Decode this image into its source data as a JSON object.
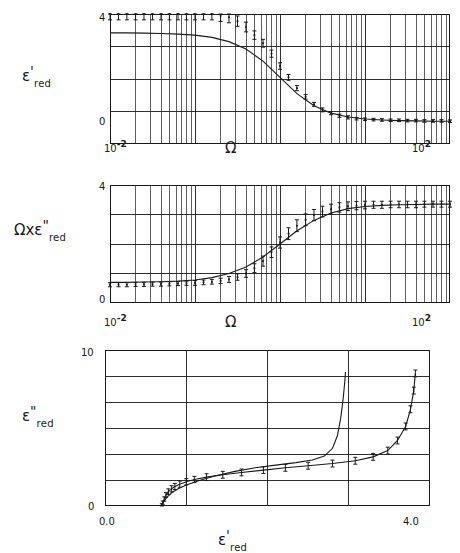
{
  "figure": {
    "background": "#ffffff",
    "ink": "#1a1a1a"
  },
  "chart_data": [
    {
      "id": "panel-eps-real",
      "type": "line",
      "title": "",
      "xlabel": "Ω",
      "ylabel": "ε'red",
      "ylabel_parts": {
        "base": "ε",
        "prime": "'",
        "sub": "red"
      },
      "xscale": "log",
      "xlim": [
        0.01,
        100
      ],
      "ylim": [
        0,
        4
      ],
      "xtick_labels": [
        "10-2",
        "102"
      ],
      "xtick_mantissa": "10",
      "xtick_exponents": [
        "-2",
        "2"
      ],
      "ytick_labels": [
        "0",
        "4"
      ],
      "grid": "log-minor-vertical + 4-horizontal",
      "series": [
        {
          "name": "model-curve",
          "kind": "line",
          "x": [
            0.01,
            0.0158,
            0.0251,
            0.0398,
            0.0631,
            0.1,
            0.158,
            0.251,
            0.398,
            0.631,
            1.0,
            1.585,
            2.512,
            3.981,
            6.31,
            10.0,
            15.85,
            25.12,
            39.81,
            63.1,
            100.0
          ],
          "y": [
            3.42,
            3.42,
            3.41,
            3.4,
            3.38,
            3.35,
            3.28,
            3.15,
            2.92,
            2.55,
            2.05,
            1.55,
            1.18,
            0.95,
            0.83,
            0.77,
            0.74,
            0.72,
            0.71,
            0.7,
            0.7
          ]
        },
        {
          "name": "measured-points",
          "kind": "points-with-errorbars",
          "x": [
            0.01,
            0.0126,
            0.0158,
            0.02,
            0.0251,
            0.0316,
            0.0398,
            0.05,
            0.0631,
            0.0794,
            0.1,
            0.126,
            0.158,
            0.2,
            0.251,
            0.316,
            0.398,
            0.5,
            0.631,
            0.794,
            1.0,
            1.26,
            1.58,
            2.0,
            2.51,
            3.16,
            3.98,
            5.0,
            6.31,
            7.94,
            10.0,
            12.6,
            15.8,
            20.0,
            25.1,
            31.6,
            39.8,
            50.0,
            63.1,
            79.4,
            100.0
          ],
          "y": [
            4.0,
            4.0,
            4.0,
            4.0,
            4.0,
            4.0,
            4.0,
            4.0,
            4.0,
            4.0,
            4.0,
            4.0,
            4.0,
            3.95,
            3.9,
            3.78,
            3.6,
            3.35,
            3.1,
            2.78,
            2.4,
            2.05,
            1.72,
            1.45,
            1.22,
            1.05,
            0.95,
            0.87,
            0.82,
            0.78,
            0.76,
            0.75,
            0.74,
            0.73,
            0.73,
            0.72,
            0.72,
            0.71,
            0.71,
            0.71,
            0.7
          ],
          "yerr": [
            0.18,
            0.18,
            0.18,
            0.18,
            0.18,
            0.18,
            0.18,
            0.18,
            0.18,
            0.18,
            0.18,
            0.18,
            0.18,
            0.18,
            0.17,
            0.16,
            0.15,
            0.13,
            0.12,
            0.11,
            0.1,
            0.09,
            0.08,
            0.07,
            0.06,
            0.06,
            0.05,
            0.05,
            0.05,
            0.04,
            0.04,
            0.04,
            0.04,
            0.04,
            0.04,
            0.04,
            0.04,
            0.04,
            0.04,
            0.04,
            0.04
          ],
          "clipped_at_top": true
        }
      ]
    },
    {
      "id": "panel-omega-eps-imag",
      "type": "line",
      "title": "",
      "xlabel": "Ω",
      "ylabel": "Ωxε\"red",
      "ylabel_parts": {
        "prefix": "Ωx",
        "base": "ε",
        "prime": "\"",
        "sub": "red"
      },
      "xscale": "log",
      "xlim": [
        0.01,
        100
      ],
      "ylim": [
        0,
        4
      ],
      "xtick_labels": [
        "10-2",
        "102"
      ],
      "xtick_mantissa": "10",
      "xtick_exponents": [
        "-2",
        "2"
      ],
      "ytick_labels": [
        "0",
        "4"
      ],
      "grid": "log-minor-vertical + 4-horizontal",
      "series": [
        {
          "name": "model-curve",
          "kind": "line",
          "x": [
            0.01,
            0.0158,
            0.0251,
            0.0398,
            0.0631,
            0.1,
            0.158,
            0.251,
            0.398,
            0.631,
            1.0,
            1.585,
            2.512,
            3.981,
            6.31,
            10.0,
            15.85,
            25.12,
            39.81,
            63.1,
            100.0
          ],
          "y": [
            0.7,
            0.7,
            0.71,
            0.72,
            0.74,
            0.78,
            0.86,
            1.0,
            1.22,
            1.56,
            2.0,
            2.45,
            2.8,
            3.05,
            3.2,
            3.27,
            3.31,
            3.33,
            3.34,
            3.35,
            3.35
          ]
        },
        {
          "name": "measured-points",
          "kind": "points-with-errorbars",
          "x": [
            0.01,
            0.0126,
            0.0158,
            0.02,
            0.0251,
            0.0316,
            0.0398,
            0.05,
            0.0631,
            0.0794,
            0.1,
            0.126,
            0.158,
            0.2,
            0.251,
            0.316,
            0.398,
            0.5,
            0.631,
            0.794,
            1.0,
            1.26,
            1.58,
            2.0,
            2.51,
            3.16,
            3.98,
            5.0,
            6.31,
            7.94,
            10.0,
            12.6,
            15.8,
            20.0,
            25.1,
            31.6,
            39.8,
            50.0,
            63.1,
            79.4,
            100.0
          ],
          "y": [
            0.62,
            0.62,
            0.62,
            0.63,
            0.63,
            0.64,
            0.64,
            0.65,
            0.66,
            0.67,
            0.68,
            0.7,
            0.72,
            0.75,
            0.8,
            0.88,
            1.0,
            1.18,
            1.42,
            1.72,
            2.05,
            2.35,
            2.62,
            2.82,
            2.98,
            3.1,
            3.18,
            3.24,
            3.28,
            3.3,
            3.32,
            3.33,
            3.33,
            3.34,
            3.34,
            3.34,
            3.34,
            3.35,
            3.35,
            3.35,
            3.35
          ],
          "yerr": [
            0.07,
            0.07,
            0.07,
            0.07,
            0.07,
            0.07,
            0.07,
            0.07,
            0.07,
            0.07,
            0.08,
            0.08,
            0.08,
            0.09,
            0.1,
            0.11,
            0.13,
            0.15,
            0.17,
            0.18,
            0.19,
            0.2,
            0.2,
            0.2,
            0.19,
            0.18,
            0.17,
            0.16,
            0.15,
            0.14,
            0.13,
            0.12,
            0.12,
            0.11,
            0.11,
            0.11,
            0.11,
            0.1,
            0.1,
            0.1,
            0.1
          ]
        }
      ]
    },
    {
      "id": "panel-cole-cole",
      "type": "line",
      "title": "",
      "xlabel": "ε'red",
      "xlabel_parts": {
        "base": "ε",
        "prime": "'",
        "sub": "red"
      },
      "ylabel": "ε\"red",
      "ylabel_parts": {
        "base": "ε",
        "prime": "\"",
        "sub": "red"
      },
      "xscale": "linear",
      "xlim": [
        0.0,
        4.0
      ],
      "ylim": [
        0,
        10
      ],
      "xtick_labels": [
        "0.0",
        "4.0"
      ],
      "ytick_labels": [
        "0",
        "10"
      ],
      "grid": "3-vertical + 5-horizontal",
      "series": [
        {
          "name": "model-curve",
          "kind": "line",
          "x": [
            0.7,
            0.72,
            0.76,
            0.82,
            0.9,
            1.0,
            1.15,
            1.35,
            1.6,
            1.85,
            2.1,
            2.35,
            2.55,
            2.7,
            2.8,
            2.86,
            2.9,
            2.93,
            2.95,
            2.96
          ],
          "y": [
            0.05,
            0.25,
            0.55,
            0.85,
            1.1,
            1.35,
            1.62,
            1.92,
            2.22,
            2.45,
            2.62,
            2.78,
            2.95,
            3.2,
            3.7,
            4.5,
            5.6,
            6.8,
            7.9,
            8.6
          ]
        },
        {
          "name": "measured-points",
          "kind": "points-with-errorbars",
          "x": [
            0.7,
            0.71,
            0.73,
            0.75,
            0.78,
            0.82,
            0.86,
            0.92,
            1.0,
            1.1,
            1.25,
            1.45,
            1.68,
            1.95,
            2.22,
            2.5,
            2.8,
            3.08,
            3.3,
            3.48,
            3.6,
            3.7,
            3.76,
            3.8,
            3.82
          ],
          "y": [
            0.05,
            0.2,
            0.45,
            0.7,
            0.92,
            1.1,
            1.25,
            1.4,
            1.55,
            1.7,
            1.85,
            2.0,
            2.15,
            2.3,
            2.45,
            2.58,
            2.72,
            2.9,
            3.15,
            3.55,
            4.2,
            5.1,
            6.2,
            7.4,
            8.5
          ],
          "xerr": [
            0.0,
            0.0,
            0.0,
            0.0,
            0.0,
            0.0,
            0.0,
            0.0,
            0.0,
            0.0,
            0.0,
            0.0,
            0.0,
            0.0,
            0.0,
            0.0,
            0.0,
            0.0,
            0.0,
            0.0,
            0.0,
            0.0,
            0.0,
            0.0,
            0.0
          ],
          "yerr": [
            0.1,
            0.12,
            0.14,
            0.16,
            0.18,
            0.2,
            0.2,
            0.2,
            0.2,
            0.2,
            0.22,
            0.22,
            0.22,
            0.22,
            0.22,
            0.22,
            0.22,
            0.22,
            0.22,
            0.22,
            0.22,
            0.22,
            0.22,
            0.22,
            0.22
          ]
        }
      ]
    }
  ]
}
